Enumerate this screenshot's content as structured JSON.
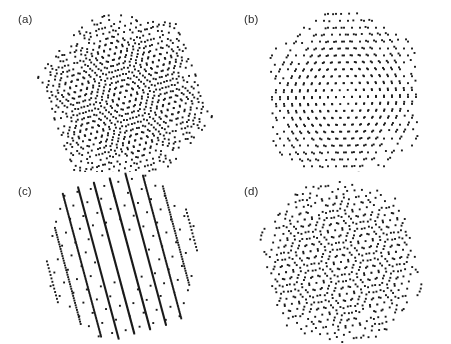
{
  "figure": {
    "width": 451,
    "height": 344,
    "background_color": "#ffffff",
    "dot_color": "#1a1a1a",
    "label_color": "#2b2b2b"
  },
  "panels": [
    {
      "id": "a",
      "label": "(a)",
      "label_x": 18,
      "label_y": 14,
      "origin_x": 0,
      "origin_y": 0,
      "width": 226,
      "height": 172,
      "center_x": 125,
      "center_y": 97,
      "radius": 86,
      "lattice_spacing": 6.4,
      "twist_angle_deg": 7.5,
      "base_rotation_deg": -21,
      "dot_size": 1.9,
      "pattern": "diagonal-moire-lines",
      "notes": "Dots align into diagonal moire rows running down to the right; sparse hexagonal rim densifying toward the core."
    },
    {
      "id": "b",
      "label": "(b)",
      "label_x": 244,
      "label_y": 14,
      "origin_x": 226,
      "origin_y": 0,
      "width": 225,
      "height": 172,
      "center_x": 118,
      "center_y": 97,
      "radius": 86,
      "lattice_spacing": 8.0,
      "twist_angle_deg": 2.0,
      "base_rotation_deg": -2,
      "dot_size": 1.9,
      "pattern": "aligned-lattice",
      "notes": "Nearly aligned hexagonal lattice with near-horizontal rows and uniform spacing; no strong interference stripes."
    },
    {
      "id": "c",
      "label": "(c)",
      "label_x": 18,
      "label_y": 186,
      "origin_x": 0,
      "origin_y": 172,
      "width": 226,
      "height": 172,
      "center_x": 122,
      "center_y": 84,
      "radius": 84,
      "lattice_spacing": 6.2,
      "twist_angle_deg": 1.0,
      "base_rotation_deg": -76,
      "dot_size": 1.9,
      "pattern": "vertical-stripe-moire",
      "stripe_count": 10,
      "stripe_tilt_deg": 15,
      "notes": "Strong one-dimensional moire: about ten dense near-vertical stripes tilted clockwise, nearly continuous at the centre and resolving into dots near the edges."
    },
    {
      "id": "d",
      "label": "(d)",
      "label_x": 244,
      "label_y": 186,
      "origin_x": 226,
      "origin_y": 172,
      "width": 225,
      "height": 172,
      "center_x": 115,
      "center_y": 90,
      "radius": 85,
      "lattice_spacing": 7.4,
      "twist_angle_deg": 13.0,
      "base_rotation_deg": -17,
      "dot_size": 1.9,
      "pattern": "twisted-superlattice",
      "notes": "Twisted bilayer moire with a rotated superlattice and irregular interference texture in the core."
    }
  ]
}
